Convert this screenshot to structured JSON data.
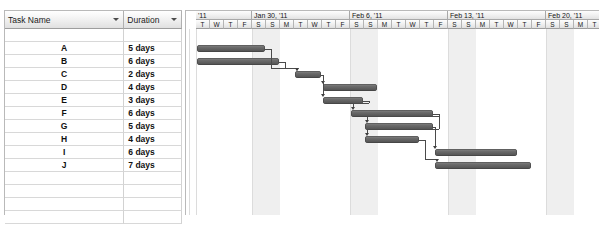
{
  "table": {
    "columns": [
      {
        "key": "task_name",
        "label": "Task Name"
      },
      {
        "key": "duration",
        "label": "Duration"
      }
    ],
    "filter_icon": "chevron-down-icon",
    "rows": [
      {
        "name": "",
        "duration": ""
      },
      {
        "name": "A",
        "duration": "5 days"
      },
      {
        "name": "B",
        "duration": "6 days"
      },
      {
        "name": "C",
        "duration": "2 days"
      },
      {
        "name": "D",
        "duration": "4 days"
      },
      {
        "name": "E",
        "duration": "3 days"
      },
      {
        "name": "F",
        "duration": "6 days"
      },
      {
        "name": "G",
        "duration": "5 days"
      },
      {
        "name": "H",
        "duration": "4 days"
      },
      {
        "name": "I",
        "duration": "6 days"
      },
      {
        "name": "J",
        "duration": "7 days"
      },
      {
        "name": "",
        "duration": ""
      },
      {
        "name": "",
        "duration": ""
      },
      {
        "name": "",
        "duration": ""
      },
      {
        "name": "",
        "duration": ""
      }
    ]
  },
  "timeline": {
    "week_labels": [
      "'11",
      "Jan 30, '11",
      "Feb 6, '11",
      "Feb 13, '11",
      "Feb 20, '11",
      "Fe"
    ],
    "day_labels": [
      "T",
      "W",
      "T",
      "F",
      "S",
      "S",
      "M",
      "T",
      "W",
      "T",
      "F",
      "S",
      "S",
      "M",
      "T",
      "W",
      "T",
      "F",
      "S",
      "S",
      "M",
      "T",
      "W",
      "T",
      "F",
      "S",
      "S",
      "M",
      "T",
      "W",
      "T",
      "F",
      "S",
      "S",
      "M",
      "T",
      "W",
      "T",
      "F",
      "S",
      "S",
      "M",
      "T",
      "W",
      "T",
      "F",
      "S",
      "S",
      "M",
      "T",
      "W",
      "T",
      "F",
      "S",
      "S"
    ],
    "weekend_day_letters": [
      "S",
      "S"
    ]
  },
  "chart_data": {
    "type": "bar",
    "xlabel": "Timeline (days)",
    "ylabel": "Task",
    "categories": [
      "A",
      "B",
      "C",
      "D",
      "E",
      "F",
      "G",
      "H",
      "I",
      "J"
    ],
    "durations_days": [
      5,
      6,
      2,
      4,
      3,
      6,
      5,
      4,
      6,
      7
    ],
    "start_offset_days": [
      0,
      0,
      7,
      9,
      9,
      11,
      12,
      12,
      17,
      17
    ],
    "bars": [
      {
        "task": "A",
        "duration_label": "5 days",
        "duration_days": 5,
        "start_day": 0,
        "end_day": 5
      },
      {
        "task": "B",
        "duration_label": "6 days",
        "duration_days": 6,
        "start_day": 0,
        "end_day": 6
      },
      {
        "task": "C",
        "duration_label": "2 days",
        "duration_days": 2,
        "start_day": 7,
        "end_day": 9
      },
      {
        "task": "D",
        "duration_label": "4 days",
        "duration_days": 4,
        "start_day": 9,
        "end_day": 13
      },
      {
        "task": "E",
        "duration_label": "3 days",
        "duration_days": 3,
        "start_day": 9,
        "end_day": 12
      },
      {
        "task": "F",
        "duration_label": "6 days",
        "duration_days": 6,
        "start_day": 11,
        "end_day": 17
      },
      {
        "task": "G",
        "duration_label": "5 days",
        "duration_days": 5,
        "start_day": 12,
        "end_day": 17
      },
      {
        "task": "H",
        "duration_label": "4 days",
        "duration_days": 4,
        "start_day": 12,
        "end_day": 16
      },
      {
        "task": "I",
        "duration_label": "6 days",
        "duration_days": 6,
        "start_day": 17,
        "end_day": 23
      },
      {
        "task": "J",
        "duration_label": "7 days",
        "duration_days": 7,
        "start_day": 17,
        "end_day": 24
      }
    ],
    "dependencies": [
      {
        "from": "A",
        "to": "C",
        "type": "finish-to-start"
      },
      {
        "from": "B",
        "to": "C",
        "type": "finish-to-start"
      },
      {
        "from": "C",
        "to": "D",
        "type": "finish-to-start"
      },
      {
        "from": "C",
        "to": "E",
        "type": "finish-to-start"
      },
      {
        "from": "E",
        "to": "F",
        "type": "finish-to-start"
      },
      {
        "from": "F",
        "to": "G",
        "type": "finish-to-start"
      },
      {
        "from": "F",
        "to": "H",
        "type": "finish-to-start"
      },
      {
        "from": "G",
        "to": "I",
        "type": "finish-to-start"
      },
      {
        "from": "H",
        "to": "J",
        "type": "finish-to-start"
      }
    ],
    "bar_color": "#5a5a5a",
    "weekend_shading_color": "#efefef",
    "grid": true,
    "legend": "none"
  }
}
